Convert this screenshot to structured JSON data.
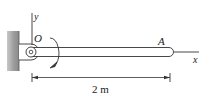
{
  "diagram": {
    "type": "mechanics-free-body",
    "labels": {
      "y_axis": "y",
      "x_axis": "x",
      "origin": "O",
      "end_point": "A",
      "length": "2 m"
    },
    "elements": {
      "support": "wall with pin bracket",
      "member": "slender rod OA",
      "rotation_arrow": "clockwise moment about O"
    },
    "colors": {
      "wall": "#a9a9a9",
      "line": "#333333",
      "background": "#ffffff"
    }
  }
}
